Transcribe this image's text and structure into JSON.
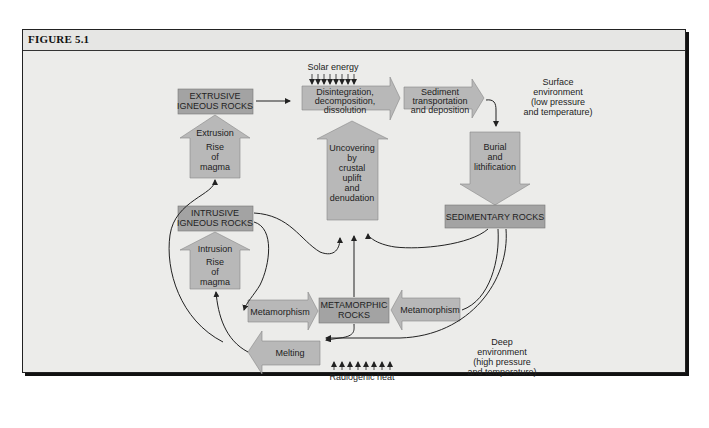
{
  "figure": {
    "title": "FIGURE 5.1"
  },
  "colors": {
    "background": "#ececea",
    "box_fill": "#a3a3a3",
    "arrow_fill": "#b8b8b8",
    "stroke": "#333333"
  },
  "nodes": {
    "extrusive": {
      "line1": "EXTRUSIVE",
      "line2": "IGNEOUS ROCKS"
    },
    "intrusive": {
      "line1": "INTRUSIVE",
      "line2": "IGNEOUS ROCKS"
    },
    "sedimentary": {
      "label": "SEDIMENTARY ROCKS"
    },
    "metamorphic": {
      "line1": "METAMORPHIC",
      "line2": "ROCKS"
    }
  },
  "processes": {
    "solar_energy": "Solar energy",
    "disintegration": {
      "line1": "Disintegration,",
      "line2": "decomposition,",
      "line3": "dissolution"
    },
    "sediment_transport": {
      "line1": "Sediment",
      "line2": "transportation",
      "line3": "and deposition"
    },
    "burial": {
      "line1": "Burial",
      "line2": "and",
      "line3": "lithification"
    },
    "uncovering": {
      "line1": "Uncovering",
      "line2": "by",
      "line3": "crustal",
      "line4": "uplift",
      "line5": "and",
      "line6": "denudation"
    },
    "extrusion": {
      "line1": "Extrusion",
      "line2": "Rise",
      "line3": "of",
      "line4": "magma"
    },
    "intrusion": {
      "line1": "Intrusion",
      "line2": "Rise",
      "line3": "of",
      "line4": "magma"
    },
    "metamorphism_left": "Metamorphism",
    "metamorphism_right": "Metamorphism",
    "melting": "Melting",
    "radiogenic_heat": "Radiogenic heat"
  },
  "environments": {
    "surface": {
      "line1": "Surface",
      "line2": "environment",
      "line3": "(low pressure",
      "line4": "and temperature)"
    },
    "deep": {
      "line1": "Deep",
      "line2": "environment",
      "line3": "(high pressure",
      "line4": "and temperature)"
    }
  }
}
